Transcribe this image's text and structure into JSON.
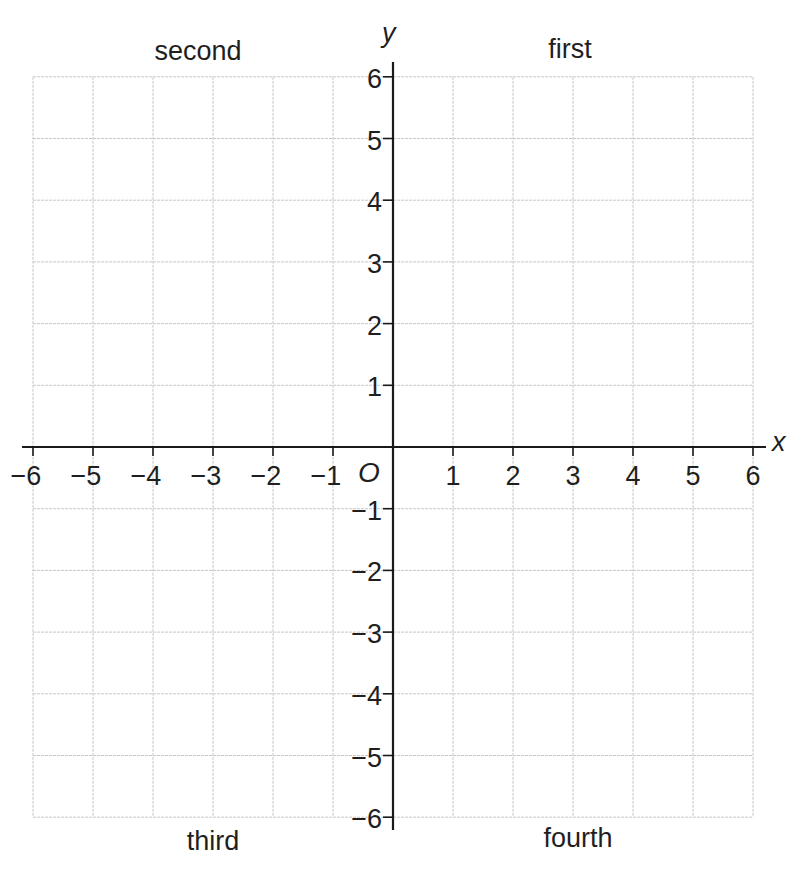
{
  "chart_data": {
    "type": "scatter",
    "title": "",
    "xlabel": "x",
    "ylabel": "y",
    "origin_label": "O",
    "xlim": [
      -6,
      6
    ],
    "ylim": [
      -6,
      6
    ],
    "grid": true,
    "x_ticks": [
      -6,
      -5,
      -4,
      -3,
      -2,
      -1,
      1,
      2,
      3,
      4,
      5,
      6
    ],
    "x_tick_labels": [
      "−6",
      "−5",
      "−4",
      "−3",
      "−2",
      "−1",
      "1",
      "2",
      "3",
      "4",
      "5",
      "6"
    ],
    "y_ticks": [
      6,
      5,
      4,
      3,
      2,
      1,
      -1,
      -2,
      -3,
      -4,
      -5,
      -6
    ],
    "y_tick_labels": [
      "6",
      "5",
      "4",
      "3",
      "2",
      "1",
      "−1",
      "−2",
      "−3",
      "−4",
      "−5",
      "−6"
    ],
    "quadrant_labels": {
      "first": "first",
      "second": "second",
      "third": "third",
      "fourth": "fourth"
    },
    "series": []
  },
  "colors": {
    "axis": "#1a1a1a",
    "grid": "#c8c8c8",
    "text": "#1f1f1f"
  }
}
